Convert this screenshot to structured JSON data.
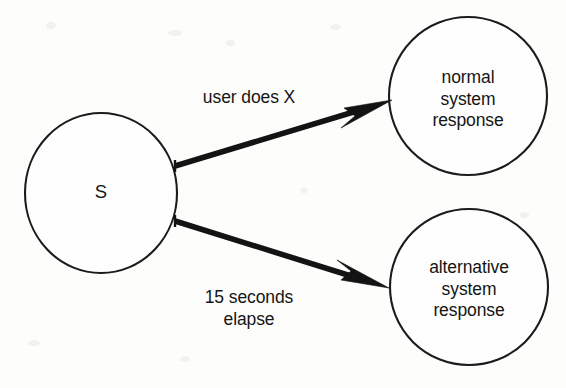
{
  "diagram": {
    "type": "state-transition-diagram",
    "background_color": "#fdfdfc",
    "ink_color": "#131313",
    "nodes": [
      {
        "id": "start",
        "name": "start-state-node",
        "label": "S",
        "cx": 101,
        "cy": 193,
        "rx": 76,
        "ry": 80
      },
      {
        "id": "normal",
        "name": "normal-response-node",
        "label": "normal\nsystem\nresponse",
        "cx": 468,
        "cy": 96,
        "rx": 79,
        "ry": 79
      },
      {
        "id": "alternative",
        "name": "alternative-response-node",
        "label": "alternative\nsystem\nresponse",
        "cx": 469,
        "cy": 287,
        "rx": 79,
        "ry": 78
      }
    ],
    "edges": [
      {
        "id": "edge-user-does-x",
        "name": "transition-user-does-x",
        "label": "user does X",
        "from": "start",
        "to": "normal",
        "label_x": 249,
        "label_y": 98,
        "x1": 175,
        "y1": 166,
        "x2": 392,
        "y2": 100
      },
      {
        "id": "edge-15-seconds-elapse",
        "name": "transition-timeout",
        "label": "15 seconds\nelapse",
        "from": "start",
        "to": "alternative",
        "label_x": 249,
        "label_y": 308,
        "x1": 175,
        "y1": 221,
        "x2": 389,
        "y2": 288
      }
    ]
  }
}
